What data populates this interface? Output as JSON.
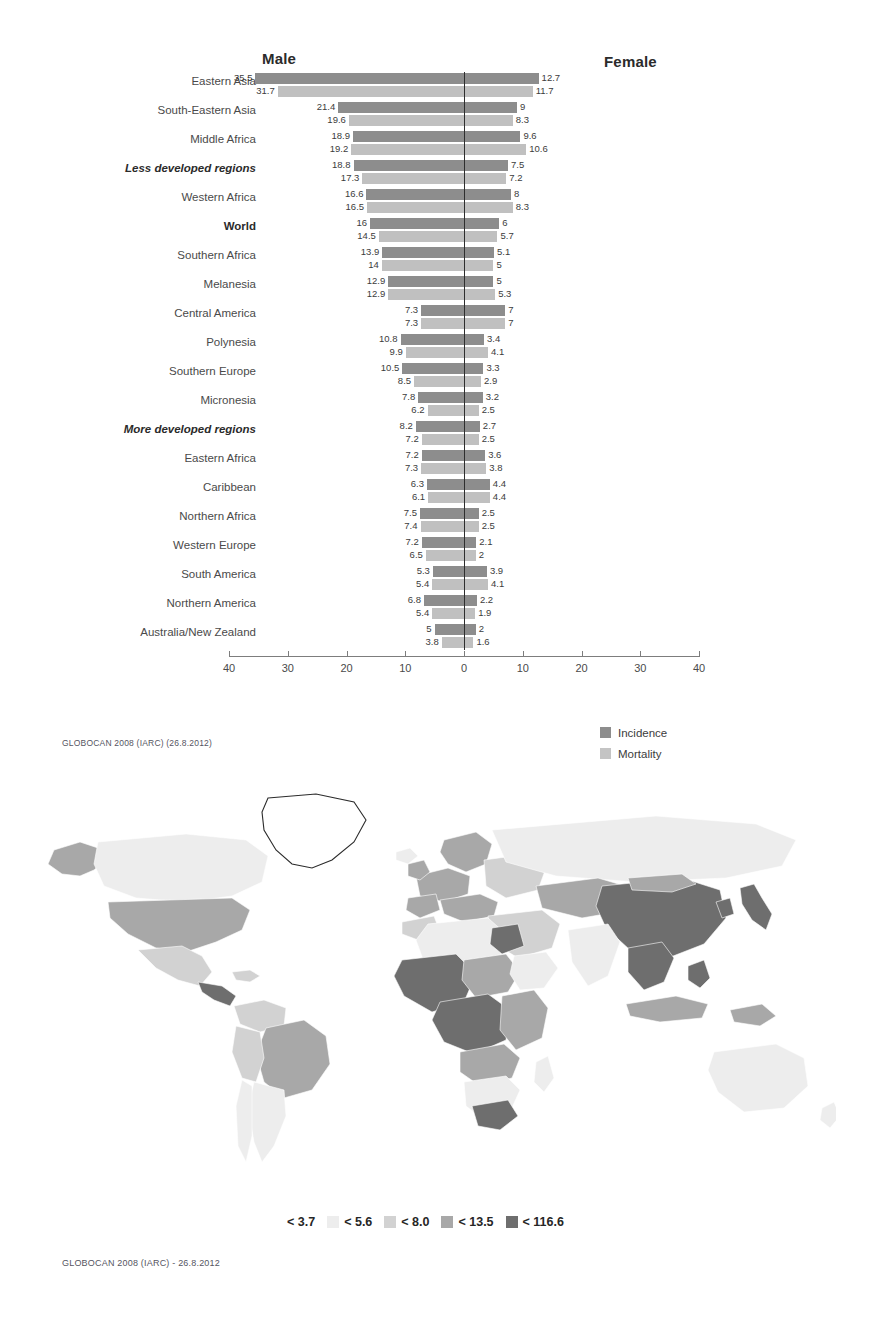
{
  "pyramid": {
    "male_header": "Male",
    "female_header": "Female",
    "source": "GLOBOCAN 2008 (IARC) (26.8.2012)",
    "legend": [
      {
        "label": "Incidence",
        "color": "#8d8d8d"
      },
      {
        "label": "Mortality",
        "color": "#c4c4c4"
      }
    ]
  },
  "map": {
    "source": "GLOBOCAN 2008 (IARC) - 26.8.2012",
    "legend": [
      {
        "label": "< 3.7",
        "color": "#ffffff"
      },
      {
        "label": "< 5.6",
        "color": "#ededed"
      },
      {
        "label": "< 8.0",
        "color": "#d2d2d2"
      },
      {
        "label": "< 13.5",
        "color": "#a8a8a8"
      },
      {
        "label": "< 116.6",
        "color": "#6e6e6e"
      }
    ]
  },
  "chart_data": {
    "type": "bar",
    "title": "",
    "subtitle": "",
    "orientation": "horizontal-diverging",
    "xlabel": "",
    "ylabel": "",
    "xlim": [
      -40,
      40
    ],
    "xticks": [
      40,
      30,
      20,
      10,
      0,
      10,
      20,
      30,
      40
    ],
    "grid": false,
    "legend_position": "bottom-right",
    "axis_note": "Left side = Male rates, right side = Female rates; age-standardised rate per 100,000",
    "categories": [
      "Eastern Asia",
      "South-Eastern Asia",
      "Middle Africa",
      "Less developed regions",
      "Western Africa",
      "World",
      "Southern Africa",
      "Melanesia",
      "Central America",
      "Polynesia",
      "Southern Europe",
      "Micronesia",
      "More developed regions",
      "Eastern Africa",
      "Caribbean",
      "Northern Africa",
      "Western Europe",
      "South America",
      "Northern America",
      "Australia/New Zealand"
    ],
    "category_styles": [
      "normal",
      "normal",
      "normal",
      "bold-italic",
      "normal",
      "bold",
      "normal",
      "normal",
      "normal",
      "normal",
      "normal",
      "normal",
      "bold-italic",
      "normal",
      "normal",
      "normal",
      "normal",
      "normal",
      "normal",
      "normal"
    ],
    "series": [
      {
        "name": "Male Incidence",
        "side": "left",
        "measure": "Incidence",
        "color": "#8d8d8d",
        "values": [
          35.5,
          21.4,
          18.9,
          18.8,
          16.6,
          16,
          13.9,
          12.9,
          7.3,
          10.8,
          10.5,
          7.8,
          8.2,
          7.2,
          6.3,
          7.5,
          7.2,
          5.3,
          6.8,
          5
        ]
      },
      {
        "name": "Male Mortality",
        "side": "left",
        "measure": "Mortality",
        "color": "#c0c0c0",
        "values": [
          31.7,
          19.6,
          19.2,
          17.3,
          16.5,
          14.5,
          14,
          12.9,
          7.3,
          9.9,
          8.5,
          6.2,
          7.2,
          7.3,
          6.1,
          7.4,
          6.5,
          5.4,
          5.4,
          3.8
        ]
      },
      {
        "name": "Female Incidence",
        "side": "right",
        "measure": "Incidence",
        "color": "#8d8d8d",
        "values": [
          12.7,
          9,
          9.6,
          7.5,
          8,
          6,
          5.1,
          5,
          7,
          3.4,
          3.3,
          3.2,
          2.7,
          3.6,
          4.4,
          2.5,
          2.1,
          3.9,
          2.2,
          2
        ]
      },
      {
        "name": "Female Mortality",
        "side": "right",
        "measure": "Mortality",
        "color": "#c0c0c0",
        "values": [
          11.7,
          8.3,
          10.6,
          7.2,
          8.3,
          5.7,
          5,
          5.3,
          7,
          4.1,
          2.9,
          2.5,
          2.5,
          3.8,
          4.4,
          2.5,
          2,
          4.1,
          1.9,
          1.6
        ]
      }
    ]
  }
}
